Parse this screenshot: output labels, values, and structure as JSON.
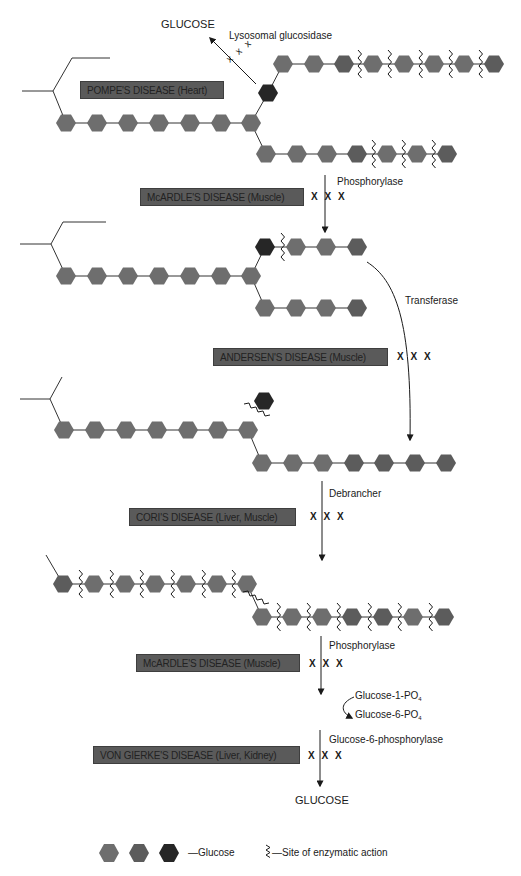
{
  "colors": {
    "glucose_medium": "#6e6e6e",
    "glucose_dark": "#5c5c5c",
    "glucose_black": "#262626",
    "disease_box": "#5a5a5a",
    "line": "#333333"
  },
  "stage1": {
    "disease": "POMPE'S DISEASE (Heart)",
    "enzyme": "Lysosomal glucosidase",
    "product": "GLUCOSE",
    "block": "x x x"
  },
  "stage2": {
    "disease": "McARDLE'S DISEASE (Muscle)",
    "enzyme": "Phosphorylase",
    "block": "X X X"
  },
  "stage3": {
    "disease": "ANDERSEN'S DISEASE (Muscle)",
    "enzyme": "Transferase",
    "block": "X X X"
  },
  "stage4": {
    "disease": "CORI'S DISEASE (Liver, Muscle)",
    "enzyme": "Debrancher",
    "block": "X X X"
  },
  "stage5": {
    "disease": "McARDLE'S DISEASE (Muscle)",
    "enzyme": "Phosphorylase",
    "block": "X X X",
    "intermediate_1": "Glucose-1-PO",
    "intermediate_2": "Glucose-6-PO",
    "subscript": "4"
  },
  "stage6": {
    "disease": "VON GIERKE'S DISEASE (Liver, Kidney)",
    "enzyme": "Glucose-6-phosphorylase",
    "block": "X X X",
    "product": "GLUCOSE"
  },
  "legend": {
    "glucose_label": "—Glucose",
    "site_label": "—Site of enzymatic action"
  },
  "diagram": {
    "hexagons": [
      {
        "x": 66,
        "y": 123,
        "c": "m"
      },
      {
        "x": 97,
        "y": 123,
        "c": "m"
      },
      {
        "x": 128,
        "y": 123,
        "c": "m"
      },
      {
        "x": 159,
        "y": 123,
        "c": "m"
      },
      {
        "x": 190,
        "y": 123,
        "c": "m"
      },
      {
        "x": 221,
        "y": 123,
        "c": "m"
      },
      {
        "x": 251,
        "y": 123,
        "c": "m"
      },
      {
        "x": 268,
        "y": 93,
        "c": "b"
      },
      {
        "x": 283,
        "y": 64,
        "c": "m"
      },
      {
        "x": 314,
        "y": 64,
        "c": "m"
      },
      {
        "x": 344,
        "y": 64,
        "c": "d"
      },
      {
        "x": 373,
        "y": 64,
        "c": "m"
      },
      {
        "x": 404,
        "y": 64,
        "c": "m"
      },
      {
        "x": 434,
        "y": 64,
        "c": "m"
      },
      {
        "x": 464,
        "y": 64,
        "c": "m"
      },
      {
        "x": 494,
        "y": 64,
        "c": "d"
      },
      {
        "x": 266,
        "y": 154,
        "c": "m"
      },
      {
        "x": 297,
        "y": 154,
        "c": "m"
      },
      {
        "x": 327,
        "y": 154,
        "c": "m"
      },
      {
        "x": 357,
        "y": 154,
        "c": "d"
      },
      {
        "x": 387,
        "y": 154,
        "c": "m"
      },
      {
        "x": 417,
        "y": 154,
        "c": "m"
      },
      {
        "x": 447,
        "y": 154,
        "c": "d"
      },
      {
        "x": 66,
        "y": 276,
        "c": "m"
      },
      {
        "x": 97,
        "y": 276,
        "c": "m"
      },
      {
        "x": 128,
        "y": 276,
        "c": "m"
      },
      {
        "x": 159,
        "y": 276,
        "c": "m"
      },
      {
        "x": 190,
        "y": 276,
        "c": "m"
      },
      {
        "x": 221,
        "y": 276,
        "c": "m"
      },
      {
        "x": 251,
        "y": 276,
        "c": "m"
      },
      {
        "x": 265,
        "y": 247,
        "c": "b"
      },
      {
        "x": 296,
        "y": 247,
        "c": "m"
      },
      {
        "x": 326,
        "y": 247,
        "c": "m"
      },
      {
        "x": 357,
        "y": 247,
        "c": "d"
      },
      {
        "x": 265,
        "y": 308,
        "c": "m"
      },
      {
        "x": 296,
        "y": 308,
        "c": "m"
      },
      {
        "x": 326,
        "y": 308,
        "c": "m"
      },
      {
        "x": 357,
        "y": 308,
        "c": "d"
      },
      {
        "x": 64,
        "y": 430,
        "c": "m"
      },
      {
        "x": 95,
        "y": 430,
        "c": "m"
      },
      {
        "x": 126,
        "y": 430,
        "c": "m"
      },
      {
        "x": 157,
        "y": 430,
        "c": "m"
      },
      {
        "x": 188,
        "y": 430,
        "c": "m"
      },
      {
        "x": 218,
        "y": 430,
        "c": "m"
      },
      {
        "x": 248,
        "y": 430,
        "c": "m"
      },
      {
        "x": 264,
        "y": 401,
        "c": "b"
      },
      {
        "x": 262,
        "y": 463,
        "c": "m"
      },
      {
        "x": 293,
        "y": 463,
        "c": "m"
      },
      {
        "x": 323,
        "y": 463,
        "c": "m"
      },
      {
        "x": 354,
        "y": 463,
        "c": "d"
      },
      {
        "x": 384,
        "y": 463,
        "c": "d"
      },
      {
        "x": 415,
        "y": 463,
        "c": "d"
      },
      {
        "x": 446,
        "y": 463,
        "c": "d"
      },
      {
        "x": 63,
        "y": 584,
        "c": "d"
      },
      {
        "x": 94,
        "y": 584,
        "c": "m"
      },
      {
        "x": 125,
        "y": 584,
        "c": "m"
      },
      {
        "x": 155,
        "y": 584,
        "c": "m"
      },
      {
        "x": 186,
        "y": 584,
        "c": "m"
      },
      {
        "x": 217,
        "y": 584,
        "c": "m"
      },
      {
        "x": 247,
        "y": 584,
        "c": "m"
      },
      {
        "x": 262,
        "y": 617,
        "c": "m"
      },
      {
        "x": 292,
        "y": 617,
        "c": "m"
      },
      {
        "x": 322,
        "y": 617,
        "c": "m"
      },
      {
        "x": 352,
        "y": 617,
        "c": "d"
      },
      {
        "x": 383,
        "y": 617,
        "c": "d"
      },
      {
        "x": 413,
        "y": 617,
        "c": "m"
      },
      {
        "x": 444,
        "y": 617,
        "c": "d"
      }
    ],
    "bonds": [
      [
        66,
        123,
        251,
        123
      ],
      [
        251,
        123,
        268,
        93
      ],
      [
        268,
        93,
        283,
        64
      ],
      [
        283,
        64,
        494,
        64
      ],
      [
        251,
        123,
        266,
        154
      ],
      [
        266,
        154,
        447,
        154
      ],
      [
        66,
        276,
        251,
        276
      ],
      [
        251,
        276,
        265,
        247
      ],
      [
        265,
        247,
        357,
        247
      ],
      [
        251,
        276,
        265,
        308
      ],
      [
        265,
        308,
        357,
        308
      ],
      [
        64,
        430,
        248,
        430
      ],
      [
        248,
        430,
        262,
        463
      ],
      [
        262,
        463,
        446,
        463
      ],
      [
        63,
        584,
        247,
        584
      ],
      [
        247,
        584,
        262,
        617
      ],
      [
        262,
        617,
        444,
        617
      ]
    ],
    "branch_lines": [
      [
        22,
        91,
        53,
        91
      ],
      [
        53,
        91,
        72,
        58
      ],
      [
        72,
        58,
        110,
        58
      ],
      [
        53,
        91,
        66,
        123
      ],
      [
        20,
        244,
        51,
        244
      ],
      [
        51,
        244,
        63,
        222
      ],
      [
        63,
        222,
        106,
        222
      ],
      [
        51,
        244,
        66,
        276
      ],
      [
        20,
        399,
        50,
        399
      ],
      [
        50,
        399,
        62,
        377
      ],
      [
        50,
        399,
        64,
        430
      ],
      [
        46,
        555,
        63,
        584
      ]
    ],
    "wavy_v": [
      [
        358,
        64
      ],
      [
        388,
        64
      ],
      [
        419,
        64
      ],
      [
        449,
        64
      ],
      [
        479,
        64
      ],
      [
        372,
        154
      ],
      [
        402,
        154
      ],
      [
        432,
        154
      ],
      [
        281,
        247
      ],
      [
        79,
        584
      ],
      [
        110,
        584
      ],
      [
        140,
        584
      ],
      [
        171,
        584
      ],
      [
        202,
        584
      ],
      [
        232,
        584
      ],
      [
        277,
        617
      ],
      [
        307,
        617
      ],
      [
        337,
        617
      ],
      [
        368,
        617
      ],
      [
        398,
        617
      ],
      [
        429,
        617
      ]
    ],
    "wavy_diag": [
      [
        256,
        412
      ],
      [
        255,
        600
      ]
    ]
  }
}
